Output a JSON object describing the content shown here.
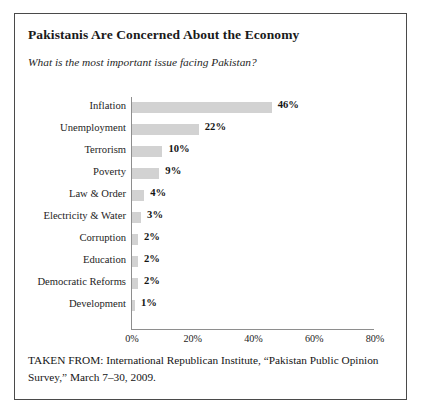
{
  "figure": {
    "title": "Pakistanis Are Concerned About the Economy",
    "subtitle": "What is the most important issue facing Pakistan?",
    "caption": "TAKEN FROM: International Republican Institute, “Pakistan Public Opinion Survey,” March 7–30, 2009.",
    "bar_color": "#d2d2d2",
    "axis_color": "#8e8e8e",
    "border_color": "#4a4a4a",
    "background": "#ffffff"
  },
  "chart_data": {
    "type": "bar",
    "orientation": "horizontal",
    "title": "Pakistanis Are Concerned About the Economy",
    "subtitle": "What is the most important issue facing Pakistan?",
    "xlabel": "",
    "ylabel": "",
    "xlim": [
      0,
      80
    ],
    "grid": false,
    "legend": "none",
    "tick_labels": [
      "0%",
      "20%",
      "40%",
      "60%",
      "80%"
    ],
    "tick_values": [
      0,
      20,
      40,
      60,
      80
    ],
    "categories": [
      "Inflation",
      "Unemployment",
      "Terrorism",
      "Poverty",
      "Law & Order",
      "Electricity & Water",
      "Corruption",
      "Education",
      "Democratic Reforms",
      "Development"
    ],
    "values": [
      46,
      22,
      10,
      9,
      4,
      3,
      2,
      2,
      2,
      1
    ],
    "data_labels": [
      "46%",
      "22%",
      "10%",
      "9%",
      "4%",
      "3%",
      "2%",
      "2%",
      "2%",
      "1%"
    ]
  }
}
